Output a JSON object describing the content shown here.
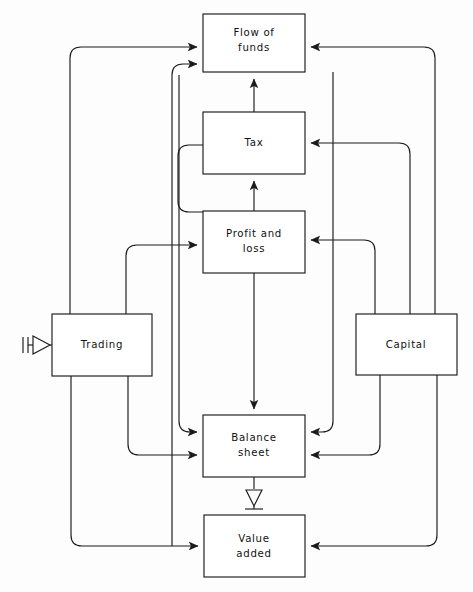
{
  "diagram": {
    "type": "block-flow-diagram",
    "background_color": "#fdfdfd",
    "line_color": "#1b1b1b",
    "nodes": [
      {
        "id": "flow-of-funds",
        "label_line1": "Flow of",
        "label_line2": "funds",
        "x": 203,
        "y": 14,
        "w": 102,
        "h": 58
      },
      {
        "id": "tax",
        "label_line1": "Tax",
        "label_line2": "",
        "x": 203,
        "y": 112,
        "w": 102,
        "h": 62
      },
      {
        "id": "profit-and-loss",
        "label_line1": "Profit and",
        "label_line2": "loss",
        "x": 203,
        "y": 211,
        "w": 102,
        "h": 62
      },
      {
        "id": "trading",
        "label_line1": "Trading",
        "label_line2": "",
        "x": 52,
        "y": 314,
        "w": 100,
        "h": 62
      },
      {
        "id": "capital",
        "label_line1": "Capital",
        "label_line2": "",
        "x": 356,
        "y": 314,
        "w": 101,
        "h": 61
      },
      {
        "id": "balance-sheet",
        "label_line1": "Balance",
        "label_line2": "sheet",
        "x": 203,
        "y": 415,
        "w": 102,
        "h": 62
      },
      {
        "id": "value-added",
        "label_line1": "Value",
        "label_line2": "added",
        "x": 204,
        "y": 515,
        "w": 101,
        "h": 62
      }
    ],
    "symbols": [
      {
        "id": "input-terminator",
        "kind": "double-bar-open-arrow",
        "x": 22,
        "y": 344
      },
      {
        "id": "output-terminator",
        "kind": "open-arrow-down-ground",
        "x": 254,
        "y": 479
      }
    ],
    "edges": [
      {
        "from": "trading",
        "to": "flow-of-funds",
        "arrow": "left-in"
      },
      {
        "from": "value-added",
        "to": "flow-of-funds",
        "arrow": "left-in"
      },
      {
        "from": "capital",
        "to": "flow-of-funds",
        "arrow": "right-in"
      },
      {
        "from": "tax",
        "to": "flow-of-funds",
        "arrow": "bottom-in"
      },
      {
        "from": "profit-and-loss",
        "to": "tax",
        "arrow": "bottom-in"
      },
      {
        "from": "capital",
        "to": "tax",
        "arrow": "right-in"
      },
      {
        "from": "trading",
        "to": "profit-and-loss",
        "arrow": "left-in"
      },
      {
        "from": "capital",
        "to": "profit-and-loss",
        "arrow": "right-in"
      },
      {
        "from": "profit-and-loss",
        "to": "balance-sheet",
        "arrow": "top-in"
      },
      {
        "from": "trading",
        "to": "balance-sheet",
        "arrow": "left-in"
      },
      {
        "from": "flow-of-funds",
        "to": "balance-sheet",
        "arrow": "left-in"
      },
      {
        "from": "capital",
        "to": "balance-sheet",
        "arrow": "right-in"
      },
      {
        "from": "tax",
        "to": "balance-sheet",
        "arrow": "right-in"
      },
      {
        "from": "trading",
        "to": "value-added",
        "arrow": "left-in"
      },
      {
        "from": "capital",
        "to": "value-added",
        "arrow": "right-in"
      },
      {
        "from": "balance-sheet",
        "to": "output-terminator",
        "arrow": "down-open"
      }
    ]
  }
}
